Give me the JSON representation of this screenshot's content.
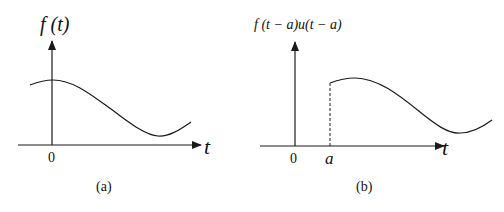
{
  "panel_a": {
    "ylabel": "f (t)",
    "xlabel": "t",
    "origin_tick": "0",
    "caption": "(a)"
  },
  "panel_b": {
    "ylabel": "f (t − a)u(t − a)",
    "xlabel": "t",
    "origin_tick": "0",
    "shift_tick": "a",
    "caption": "(b)"
  },
  "colors": {
    "stroke": "#1a1a1a",
    "background": "#ffffff"
  }
}
